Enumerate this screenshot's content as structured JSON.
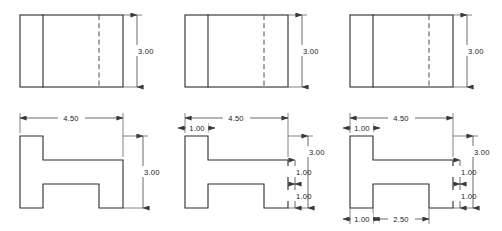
{
  "sheet": {
    "title": "Orthographic Multiview Drawing - Stepped H-Block",
    "background_color": "#ffffff",
    "line_color": "#2b2b2b",
    "hidden_line_color": "#4a4a4a",
    "dimension_line_color": "#3a3a3a",
    "text_color": "#1a1a1a"
  },
  "views": [
    {
      "id": "view-1",
      "column_label": "Stage 1",
      "top_view": {
        "name": "top-view-1",
        "dimensions": [
          {
            "name": "height-3-00",
            "value": "3.00",
            "orientation": "vertical",
            "position": "right"
          }
        ]
      },
      "front_view": {
        "name": "front-view-1",
        "dimensions": [
          {
            "name": "width-4-50",
            "value": "4.50",
            "orientation": "horizontal",
            "position": "top"
          },
          {
            "name": "height-3-00",
            "value": "3.00",
            "orientation": "vertical",
            "position": "right"
          }
        ]
      }
    },
    {
      "id": "view-2",
      "column_label": "Stage 2",
      "top_view": {
        "name": "top-view-2",
        "dimensions": [
          {
            "name": "height-3-00",
            "value": "3.00",
            "orientation": "vertical",
            "position": "right"
          }
        ]
      },
      "front_view": {
        "name": "front-view-2",
        "dimensions": [
          {
            "name": "width-4-50",
            "value": "4.50",
            "orientation": "horizontal",
            "position": "top"
          },
          {
            "name": "flange-width-1-00",
            "value": "1.00",
            "orientation": "horizontal",
            "position": "top-left"
          },
          {
            "name": "height-3-00",
            "value": "3.00",
            "orientation": "vertical",
            "position": "right-outer"
          },
          {
            "name": "upper-step-1-00",
            "value": "1.00",
            "orientation": "vertical",
            "position": "right-inner-upper"
          },
          {
            "name": "lower-step-1-00",
            "value": "1.00",
            "orientation": "vertical",
            "position": "right-inner-lower"
          }
        ]
      }
    },
    {
      "id": "view-3",
      "column_label": "Stage 3",
      "top_view": {
        "name": "top-view-3",
        "dimensions": [
          {
            "name": "height-3-00",
            "value": "3.00",
            "orientation": "vertical",
            "position": "right"
          }
        ]
      },
      "front_view": {
        "name": "front-view-3",
        "dimensions": [
          {
            "name": "width-4-50",
            "value": "4.50",
            "orientation": "horizontal",
            "position": "top"
          },
          {
            "name": "flange-width-1-00",
            "value": "1.00",
            "orientation": "horizontal",
            "position": "top-left"
          },
          {
            "name": "height-3-00",
            "value": "3.00",
            "orientation": "vertical",
            "position": "right-outer"
          },
          {
            "name": "upper-step-1-00",
            "value": "1.00",
            "orientation": "vertical",
            "position": "right-inner-upper"
          },
          {
            "name": "lower-step-1-00",
            "value": "1.00",
            "orientation": "vertical",
            "position": "right-inner-lower"
          },
          {
            "name": "bottom-left-leg-1-00",
            "value": "1.00",
            "orientation": "horizontal",
            "position": "bottom-left"
          },
          {
            "name": "bottom-span-2-50",
            "value": "2.50",
            "orientation": "horizontal",
            "position": "bottom-center"
          }
        ]
      }
    }
  ],
  "labels": {
    "v1_top_h": "3.00",
    "v1_front_w": "4.50",
    "v1_front_h": "3.00",
    "v2_top_h": "3.00",
    "v2_front_w": "4.50",
    "v2_front_flange": "1.00",
    "v2_front_h": "3.00",
    "v2_front_step_up": "1.00",
    "v2_front_step_low": "1.00",
    "v3_top_h": "3.00",
    "v3_front_w": "4.50",
    "v3_front_flange": "1.00",
    "v3_front_h": "3.00",
    "v3_front_step_up": "1.00",
    "v3_front_step_low": "1.00",
    "v3_front_bot_leg": "1.00",
    "v3_front_bot_span": "2.50"
  }
}
